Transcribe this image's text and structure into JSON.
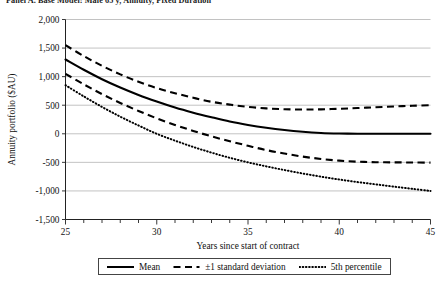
{
  "caption": "Panel A. Base Model: Male 65 y, Annuity, Fixed Duration",
  "legend": {
    "items": [
      {
        "label": "Mean",
        "style": "solid",
        "icon": "solid-line-icon"
      },
      {
        "label": "±1 standard deviation",
        "style": "dashed",
        "icon": "dashed-line-icon"
      },
      {
        "label": "5th percentile",
        "style": "dotted",
        "icon": "dotted-line-icon"
      }
    ]
  },
  "chart_data": {
    "type": "line",
    "title": "",
    "xlabel": "Years since start of contract",
    "ylabel": "Annuity portfolio ($AU)",
    "xlim": [
      25,
      45
    ],
    "ylim": [
      -1500,
      2000
    ],
    "xticks": [
      25,
      30,
      35,
      40,
      45
    ],
    "xtick_labels": [
      "25",
      "30",
      "35",
      "40",
      "45"
    ],
    "minor_xtick_step": 1,
    "yticks": [
      -1500,
      -1000,
      -500,
      0,
      500,
      1000,
      1500,
      2000
    ],
    "ytick_labels": [
      "-1,500",
      "-1,000",
      "-500",
      "0",
      "500",
      "1,000",
      "1,500",
      "2,000"
    ],
    "grid": "horizontal",
    "legend_position": "below-axis",
    "x": [
      25,
      26,
      27,
      28,
      29,
      30,
      31,
      32,
      33,
      34,
      35,
      36,
      37,
      38,
      39,
      40,
      41,
      42,
      43,
      44,
      45
    ],
    "series": [
      {
        "name": "+1 standard deviation",
        "style": "dashed",
        "values": [
          1550,
          1360,
          1190,
          1040,
          910,
          800,
          710,
          630,
          560,
          510,
          470,
          445,
          430,
          425,
          428,
          437,
          450,
          465,
          478,
          490,
          500
        ]
      },
      {
        "name": "Mean",
        "style": "solid",
        "values": [
          1300,
          1120,
          955,
          810,
          680,
          565,
          460,
          370,
          290,
          215,
          155,
          105,
          65,
          35,
          15,
          5,
          0,
          0,
          0,
          0,
          0
        ]
      },
      {
        "name": "-1 standard deviation",
        "style": "dashed",
        "values": [
          1050,
          865,
          695,
          540,
          400,
          270,
          155,
          50,
          -45,
          -130,
          -210,
          -285,
          -345,
          -400,
          -440,
          -470,
          -488,
          -497,
          -500,
          -502,
          -505
        ]
      },
      {
        "name": "5th percentile",
        "style": "dotted",
        "values": [
          850,
          655,
          470,
          300,
          145,
          0,
          -120,
          -230,
          -330,
          -420,
          -500,
          -570,
          -635,
          -695,
          -750,
          -800,
          -845,
          -885,
          -925,
          -963,
          -1000
        ]
      }
    ]
  }
}
